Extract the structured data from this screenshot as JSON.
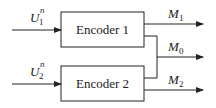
{
  "diagram": {
    "encoders": [
      {
        "label": "Encoder 1"
      },
      {
        "label": "Encoder 2"
      }
    ],
    "inputs": [
      {
        "symbol": "U",
        "subscript": "1",
        "superscript": "n"
      },
      {
        "symbol": "U",
        "subscript": "2",
        "superscript": "n"
      }
    ],
    "outputs": [
      {
        "symbol": "M",
        "subscript": "1"
      },
      {
        "symbol": "M",
        "subscript": "0"
      },
      {
        "symbol": "M",
        "subscript": "2"
      }
    ],
    "colors": {
      "stroke": "#222222",
      "background": "#ffffff"
    }
  }
}
